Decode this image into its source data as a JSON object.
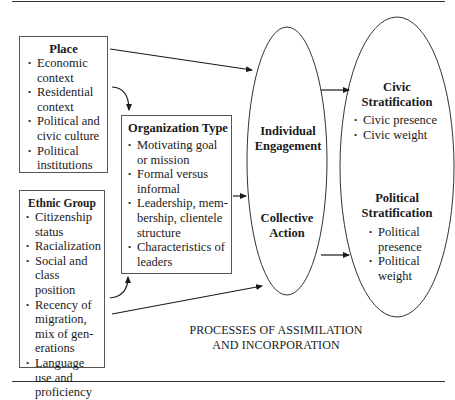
{
  "place": {
    "title": "Place",
    "items": [
      "Economic context",
      "Residential context",
      "Political and civic culture",
      "Political institutions"
    ]
  },
  "ethnic_group": {
    "title": "Ethnic Group",
    "items": [
      "Citizenship status",
      "Racialization",
      "Social and class position",
      "Recency of migration, mix of gen-erations",
      "Language use and proficiency"
    ]
  },
  "organization_type": {
    "title": "Organization Type",
    "items": [
      "Motivating goal or mission",
      "Formal versus informal",
      "Leadership, mem-bership, clientele structure",
      "Characteristics of leaders"
    ]
  },
  "middle": {
    "individual": "Individual Engagement",
    "collective": "Collective Action"
  },
  "civic": {
    "title": "Civic Stratification",
    "items": [
      "Civic presence",
      "Civic weight"
    ]
  },
  "political": {
    "title": "Political Stratification",
    "items": [
      "Political presence",
      "Political weight"
    ]
  },
  "caption": {
    "line1": "PROCESSES OF ASSIMILATION",
    "line2": "AND INCORPORATION"
  }
}
